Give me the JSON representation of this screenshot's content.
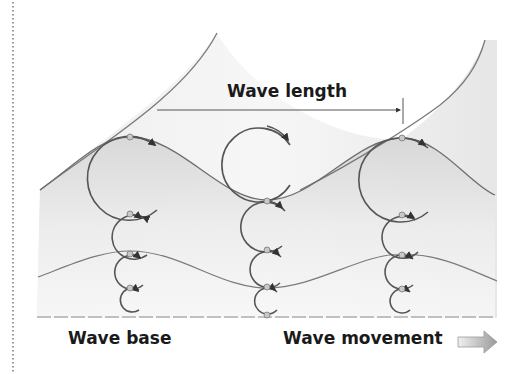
{
  "diagram": {
    "labels": {
      "wave_length": "Wave length",
      "wave_base": "Wave base",
      "wave_movement": "Wave movement"
    },
    "colors": {
      "line": "#6e6e6e",
      "circle": "#555555",
      "shade": "#d9d9d9",
      "text": "#1a1a1a",
      "arrow_fill": "#b5b5b5"
    },
    "columns": [
      {
        "name": "crest-left",
        "x": 130,
        "orbits": [
          {
            "cy": 178,
            "r": 42
          },
          {
            "cy": 236,
            "r": 22
          },
          {
            "cy": 271,
            "r": 17
          },
          {
            "cy": 300,
            "r": 12
          }
        ]
      },
      {
        "name": "trough-middle",
        "x": 267,
        "orbits": [
          {
            "cy": 163,
            "r": 37
          },
          {
            "cy": 226,
            "r": 25
          },
          {
            "cy": 268,
            "r": 18
          },
          {
            "cy": 300,
            "r": 13
          }
        ]
      },
      {
        "name": "crest-right",
        "x": 402,
        "orbits": [
          {
            "cy": 180,
            "r": 42
          },
          {
            "cy": 236,
            "r": 21
          },
          {
            "cy": 272,
            "r": 17
          },
          {
            "cy": 301,
            "r": 12
          }
        ]
      }
    ]
  }
}
